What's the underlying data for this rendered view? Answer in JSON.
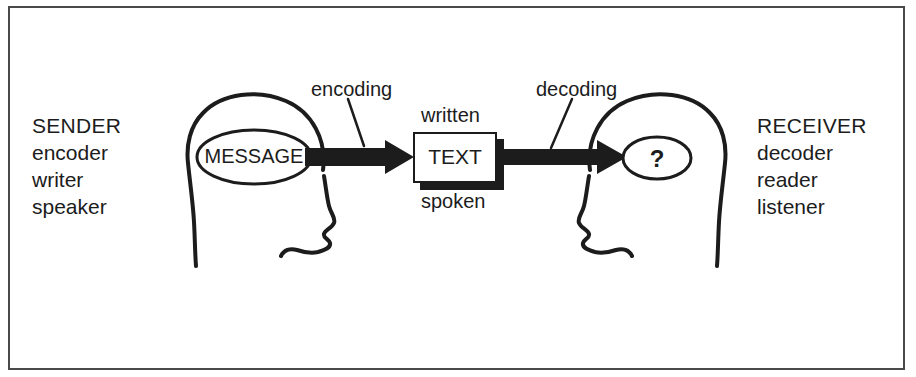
{
  "diagram": {
    "colors": {
      "ink": "#1c1c1c",
      "frame": "#4a4a4a",
      "background": "#ffffff"
    },
    "sender": {
      "title": "SENDER",
      "roles": [
        "encoder",
        "writer",
        "speaker"
      ],
      "thought_label": "MESSAGE"
    },
    "receiver": {
      "title": "RECEIVER",
      "roles": [
        "decoder",
        "reader",
        "listener"
      ],
      "thought_label": "?"
    },
    "process_labels": {
      "encoding": "encoding",
      "decoding": "decoding"
    },
    "medium": {
      "box_label": "TEXT",
      "above": "written",
      "below": "spoken"
    }
  }
}
